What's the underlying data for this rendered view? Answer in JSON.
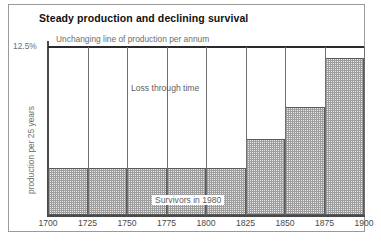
{
  "chart_title": "Steady production and declining survival",
  "annotations": {
    "production_line": "Unchanging line of production per annum",
    "loss_region": "Loss through time",
    "survivors_region": "Survivors in 1980"
  },
  "axes": {
    "y_top_label": "12.5%",
    "y_axis_title": "production per 25 years"
  },
  "chart_data": {
    "type": "bar",
    "title": "Steady production and declining survival",
    "xlabel": "",
    "ylabel": "production per 25 years",
    "ylim": [
      0,
      12.5
    ],
    "grid": false,
    "legend": "none",
    "x_tick_labels": [
      "1700",
      "1725",
      "1750",
      "1775",
      "1800",
      "1825",
      "1850",
      "1875",
      "1900"
    ],
    "categories": [
      "1700-1725",
      "1725-1750",
      "1750-1775",
      "1775-1800",
      "1800-1825",
      "1825-1850",
      "1850-1875",
      "1875-1900"
    ],
    "values": [
      3.5,
      3.5,
      3.5,
      3.5,
      3.5,
      5.65,
      8.0,
      11.7
    ],
    "reference_line": {
      "label": "Unchanging line of production per annum",
      "value": 12.5
    }
  }
}
